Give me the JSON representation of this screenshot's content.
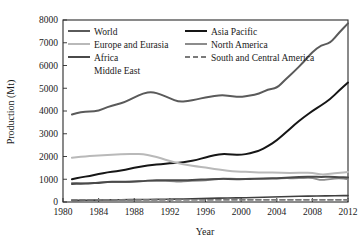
{
  "chart_data": {
    "type": "line",
    "title": "",
    "xlabel": "Year",
    "ylabel": "Production (Mt)",
    "xlim": [
      1980,
      2012
    ],
    "ylim": [
      0,
      8000
    ],
    "xticks": [
      1980,
      1984,
      1988,
      1992,
      1996,
      2000,
      2004,
      2008,
      2012
    ],
    "yticks": [
      0,
      1000,
      2000,
      3000,
      4000,
      5000,
      6000,
      7000,
      8000
    ],
    "xtick_labels": [
      "1980",
      "1984",
      "1988",
      "1992",
      "1996",
      "2000",
      "2004",
      "2008",
      "2012"
    ],
    "ytick_labels": [
      "0",
      "1000",
      "2000",
      "3000",
      "4000",
      "5000",
      "6000",
      "7000",
      "8000"
    ],
    "grid": false,
    "legend_position": "upper-left-two-columns",
    "x": [
      1981,
      1982,
      1983,
      1984,
      1985,
      1986,
      1987,
      1988,
      1989,
      1990,
      1991,
      1992,
      1993,
      1994,
      1995,
      1996,
      1997,
      1998,
      1999,
      2000,
      2001,
      2002,
      2003,
      2004,
      2005,
      2006,
      2007,
      2008,
      2009,
      2010,
      2011,
      2012
    ],
    "series": [
      {
        "name": "World",
        "color": "#5a5a5a",
        "width": 2.0,
        "dash": "none",
        "values": [
          3850,
          3950,
          3980,
          4000,
          4180,
          4280,
          4400,
          4600,
          4780,
          4850,
          4720,
          4560,
          4400,
          4430,
          4510,
          4600,
          4660,
          4700,
          4640,
          4620,
          4680,
          4750,
          4950,
          5000,
          5400,
          5750,
          6150,
          6600,
          6900,
          6980,
          7450,
          7850
        ]
      },
      {
        "name": "Asia Pacific",
        "color": "#161616",
        "width": 2.0,
        "dash": "none",
        "values": [
          1000,
          1080,
          1150,
          1230,
          1300,
          1350,
          1420,
          1500,
          1570,
          1630,
          1660,
          1700,
          1720,
          1780,
          1850,
          1960,
          2060,
          2120,
          2080,
          2070,
          2140,
          2250,
          2450,
          2700,
          3050,
          3400,
          3720,
          4000,
          4250,
          4520,
          4900,
          5250
        ]
      },
      {
        "name": "Europe and Eurasia",
        "color": "#b9b9b9",
        "width": 2.0,
        "dash": "none",
        "values": [
          1950,
          1990,
          2020,
          2040,
          2070,
          2090,
          2110,
          2110,
          2100,
          2030,
          1920,
          1800,
          1700,
          1620,
          1560,
          1520,
          1450,
          1400,
          1350,
          1330,
          1320,
          1300,
          1300,
          1290,
          1280,
          1280,
          1290,
          1290,
          1200,
          1240,
          1280,
          1320
        ]
      },
      {
        "name": "North America",
        "color": "#8c8c8c",
        "width": 1.8,
        "dash": "none",
        "values": [
          840,
          830,
          800,
          860,
          880,
          880,
          880,
          900,
          920,
          930,
          930,
          930,
          880,
          930,
          940,
          950,
          1000,
          1020,
          1030,
          1010,
          1030,
          1010,
          1020,
          1030,
          1050,
          1040,
          1060,
          1070,
          950,
          1010,
          1050,
          1000
        ]
      },
      {
        "name": "Africa",
        "color": "#4a4a4a",
        "width": 2.0,
        "dash": "none",
        "values": [
          790,
          810,
          820,
          840,
          880,
          890,
          890,
          900,
          920,
          960,
          960,
          960,
          950,
          960,
          980,
          1000,
          1010,
          1020,
          1010,
          1000,
          1020,
          1030,
          1040,
          1050,
          1070,
          1090,
          1100,
          1110,
          1100,
          1110,
          1090,
          1080
        ]
      },
      {
        "name": "Middle East",
        "color": "#3f3f3f",
        "width": 1.6,
        "dash": "none",
        "values": [
          70,
          75,
          80,
          85,
          90,
          95,
          100,
          105,
          110,
          115,
          120,
          125,
          130,
          135,
          145,
          155,
          165,
          175,
          180,
          185,
          195,
          205,
          215,
          225,
          235,
          245,
          255,
          262,
          268,
          272,
          278,
          282
        ]
      },
      {
        "name": "South and Central America",
        "color": "#7a7a7a",
        "width": 1.8,
        "dash": "5,3",
        "values": [
          95,
          95,
          95,
          95,
          95,
          95,
          95,
          95,
          95,
          95,
          95,
          95,
          95,
          95,
          95,
          95,
          95,
          95,
          95,
          95,
          95,
          95,
          95,
          95,
          95,
          95,
          95,
          95,
          95,
          95,
          95,
          95
        ]
      }
    ],
    "legend": [
      {
        "label": "World",
        "color": "#5a5a5a",
        "dash": "none",
        "width": 2.0,
        "col": 0,
        "row": 0
      },
      {
        "label": "Europe and Eurasia",
        "color": "#b9b9b9",
        "dash": "none",
        "width": 2.0,
        "col": 0,
        "row": 1
      },
      {
        "label": "Africa",
        "color": "#4a4a4a",
        "dash": "none",
        "width": 2.0,
        "col": 0,
        "row": 2
      },
      {
        "label": "Middle East",
        "color": "none",
        "dash": "none",
        "width": 0,
        "col": 0,
        "row": 3
      },
      {
        "label": "Asia Pacific",
        "color": "#161616",
        "dash": "none",
        "width": 2.0,
        "col": 1,
        "row": 0
      },
      {
        "label": "North America",
        "color": "#8c8c8c",
        "dash": "none",
        "width": 2.0,
        "col": 1,
        "row": 1
      },
      {
        "label": "South and Central America",
        "color": "#7a7a7a",
        "dash": "5,3",
        "width": 1.8,
        "col": 1,
        "row": 2
      }
    ]
  }
}
